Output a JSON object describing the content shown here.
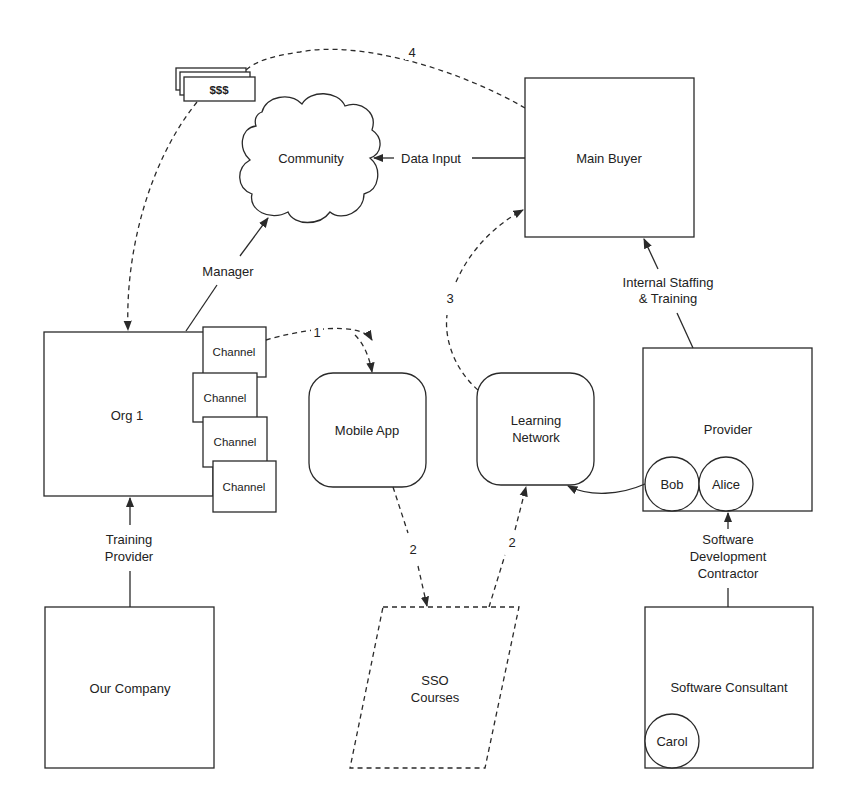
{
  "nodes": {
    "main_buyer": "Main Buyer",
    "community": "Community",
    "money": "$$$",
    "org1": "Org 1",
    "channels": [
      "Channel",
      "Channel",
      "Channel",
      "Channel"
    ],
    "mobile_app": "Mobile App",
    "learning_network": [
      "Learning",
      "Network"
    ],
    "provider": "Provider",
    "bob": "Bob",
    "alice": "Alice",
    "our_company": "Our Company",
    "sso_courses": [
      "SSO",
      "Courses"
    ],
    "software_consultant": "Software Consultant",
    "carol": "Carol"
  },
  "edges": {
    "data_input": "Data Input",
    "manager": "Manager",
    "internal_staffing": [
      "Internal Staffing",
      "& Training"
    ],
    "training_provider": [
      "Training",
      "Provider"
    ],
    "software_dev_contractor": [
      "Software",
      "Development",
      "Contractor"
    ],
    "step1": "1",
    "step2a": "2",
    "step2b": "2",
    "step3": "3",
    "step4": "4"
  },
  "colors": {
    "stroke": "#2a2a2a",
    "text": "#222222",
    "background": "#ffffff"
  }
}
